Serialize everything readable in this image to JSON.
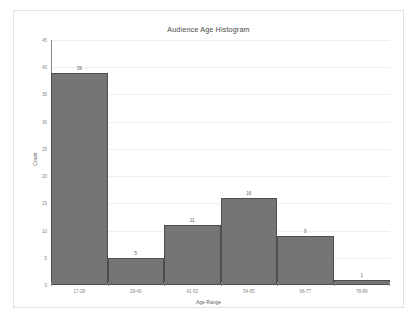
{
  "chart_data": {
    "type": "bar",
    "title": "Audience Age Histogram",
    "xlabel": "Age Range",
    "ylabel": "Count",
    "categories": [
      "17-28",
      "29-40",
      "41-53",
      "54-65",
      "66-77",
      "78-89"
    ],
    "values": [
      39,
      5,
      11,
      16,
      9,
      1
    ],
    "ylim": [
      0,
      45
    ],
    "ytick_step": 5,
    "yticks": [
      0,
      5,
      10,
      15,
      20,
      25,
      30,
      35,
      40,
      45
    ],
    "grid": true,
    "legend": false,
    "bar_color": "#757575",
    "bar_border_color": "#4e4e4e",
    "gridline_color": "#efefef",
    "axis_color": "#8a8a8a",
    "text_color": "#5e5e5e",
    "tick_label_color": "#868686",
    "background": "#ffffff",
    "data_labels": [
      "39",
      "5",
      "11",
      "16",
      "9",
      "1"
    ]
  }
}
